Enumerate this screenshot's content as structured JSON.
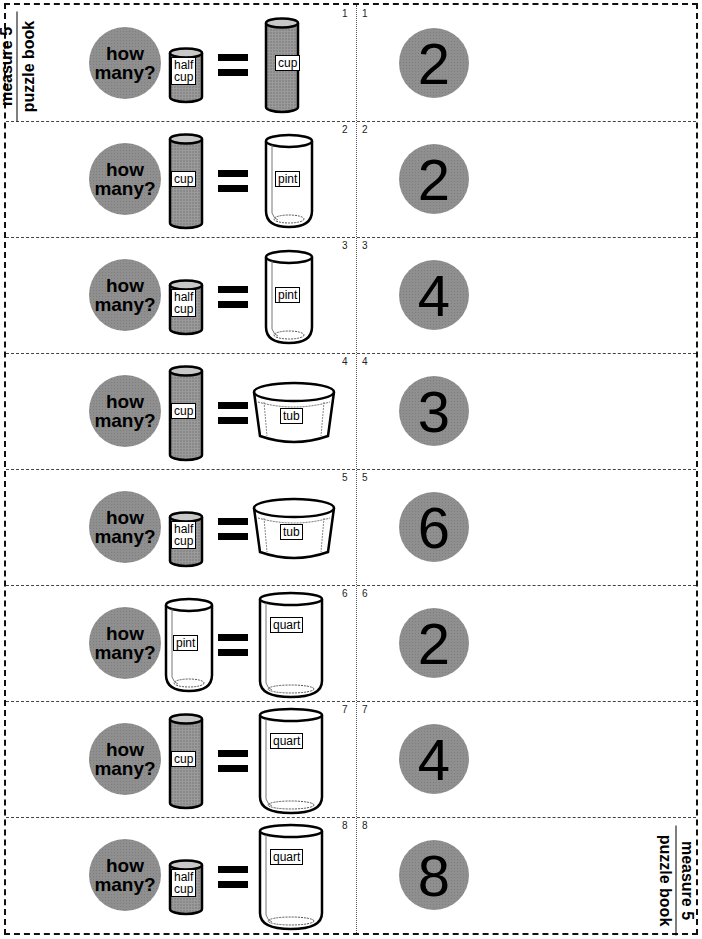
{
  "title": {
    "line1": "measure 5",
    "line2": "puzzle book"
  },
  "question_label": {
    "line1": "how",
    "line2": "many?"
  },
  "colors": {
    "circle_fill": "#8f8f8f",
    "ink": "#000000",
    "page": "#ffffff"
  },
  "cards": [
    {
      "number": "1",
      "small": "half cup",
      "small_line1": "half",
      "small_line2": "cup",
      "small_type": "half-cup-can",
      "large": "cup",
      "large_type": "cup-can",
      "answer": "2"
    },
    {
      "number": "2",
      "small": "cup",
      "small_line1": "cup",
      "small_type": "cup-can",
      "large": "pint",
      "large_type": "pint-glass",
      "answer": "2"
    },
    {
      "number": "3",
      "small": "half cup",
      "small_line1": "half",
      "small_line2": "cup",
      "small_type": "half-cup-can",
      "large": "pint",
      "large_type": "pint-glass",
      "answer": "4"
    },
    {
      "number": "4",
      "small": "cup",
      "small_line1": "cup",
      "small_type": "cup-can",
      "large": "tub",
      "large_type": "tub",
      "answer": "3"
    },
    {
      "number": "5",
      "small": "half cup",
      "small_line1": "half",
      "small_line2": "cup",
      "small_type": "half-cup-can",
      "large": "tub",
      "large_type": "tub",
      "answer": "6"
    },
    {
      "number": "6",
      "small": "pint",
      "small_line1": "pint",
      "small_type": "pint-glass",
      "large": "quart",
      "large_type": "quart-glass",
      "answer": "2"
    },
    {
      "number": "7",
      "small": "cup",
      "small_line1": "cup",
      "small_type": "cup-can",
      "large": "quart",
      "large_type": "quart-glass",
      "answer": "4"
    },
    {
      "number": "8",
      "small": "half cup",
      "small_line1": "half",
      "small_line2": "cup",
      "small_type": "half-cup-can",
      "large": "quart",
      "large_type": "quart-glass",
      "answer": "8"
    }
  ]
}
